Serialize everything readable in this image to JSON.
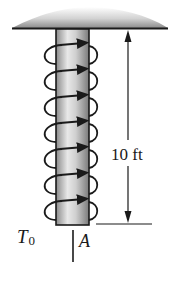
{
  "figure": {
    "type": "shaft-with-distributed-torque",
    "dimension": {
      "label": "10 ft",
      "value": 10,
      "unit": "ft"
    },
    "torque_label": {
      "symbol": "T",
      "subscript": "0"
    },
    "point_label": "A",
    "coil_count": 7,
    "colors": {
      "outline": "#1a1a1a",
      "shaft_light": "#e6e6e6",
      "shaft_dark": "#8a8a8a",
      "plate_top": "#f4f4f4",
      "plate_bottom": "#8c8c8c"
    }
  }
}
